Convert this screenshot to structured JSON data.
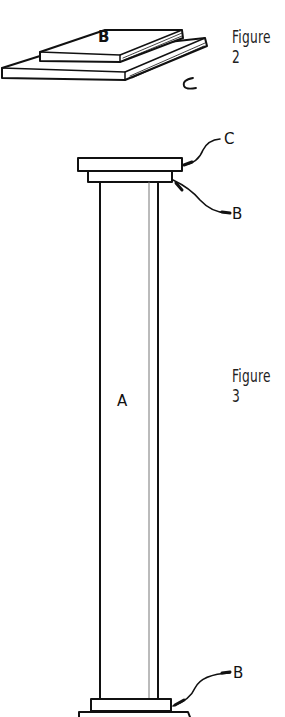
{
  "figure2": {
    "caption": "Figure 2",
    "labels": {
      "top_board": "B",
      "bottom_board": "C"
    }
  },
  "figure3": {
    "caption": "Figure 3",
    "labels": {
      "shaft": "A",
      "cap_top": "C",
      "collar_top": "B",
      "collar_bottom": "B"
    }
  },
  "colors": {
    "ink": "#111111",
    "background": "#ffffff"
  }
}
